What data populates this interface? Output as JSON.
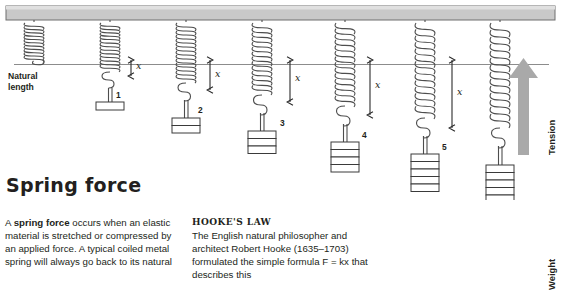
{
  "figure": {
    "natural_length_label": "Natural\nlength",
    "natural_length_line1": "Natural",
    "natural_length_line2": "length",
    "extension_symbol": "x",
    "tension_label": "Tension",
    "weight_label": "Weight",
    "springs": [
      {
        "number": "",
        "weights": 0,
        "extension": 0
      },
      {
        "number": "1",
        "weights": 1,
        "extension": 8
      },
      {
        "number": "2",
        "weights": 2,
        "extension": 20
      },
      {
        "number": "3",
        "weights": 3,
        "extension": 33
      },
      {
        "number": "4",
        "weights": 4,
        "extension": 46
      },
      {
        "number": "5",
        "weights": 5,
        "extension": 60
      },
      {
        "number": "",
        "weights": 6,
        "extension": 73
      }
    ],
    "colors": {
      "ceiling": "#c9c9c9",
      "ceiling_stroke": "#6e6e6e",
      "spring_stroke": "#4d4d4d",
      "reference_line": "#8c8c8c",
      "tension_arrow": "#a9a9a9",
      "weight_arrow": "#2b2b2b",
      "text": "#231f20"
    }
  },
  "article": {
    "title": "Spring force",
    "left_column": {
      "paragraph_pre": "A ",
      "paragraph_bold": "spring force",
      "paragraph_post": " occurs when an elastic material is stretched or compressed by an applied force. A typical coiled metal spring will always go back to its natural"
    },
    "right_column": {
      "subheading": "HOOKE'S LAW",
      "paragraph": "The English natural philosopher and architect Robert Hooke (1635–1703) formulated the simple formula F = kx that describes this"
    }
  }
}
